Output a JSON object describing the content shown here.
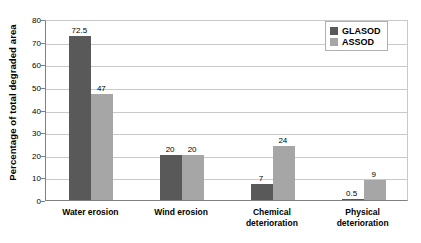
{
  "chart_data": {
    "type": "bar",
    "title": "",
    "xlabel": "",
    "ylabel": "Percentage of total degraded area",
    "ylim": [
      0,
      80
    ],
    "yticks": [
      0,
      10,
      20,
      30,
      40,
      50,
      60,
      70,
      80
    ],
    "grid": true,
    "legend_position": "top-right",
    "categories": [
      "Water erosion",
      "Wind erosion",
      "Chemical\ndeterioration",
      "Physical\ndeterioration"
    ],
    "series": [
      {
        "name": "GLASOD",
        "color": "#595959",
        "values": [
          72.5,
          20,
          7,
          0.5
        ],
        "labels": [
          "72.5",
          "20",
          "7",
          "0.5"
        ]
      },
      {
        "name": "ASSOD",
        "color": "#a6a6a6",
        "values": [
          47,
          20,
          24,
          9
        ],
        "labels": [
          "47",
          "20",
          "24",
          "9"
        ]
      }
    ]
  },
  "axis": {
    "y_title": "Percentage of total degraded area",
    "y_tick_labels": [
      "0",
      "10",
      "20",
      "30",
      "40",
      "50",
      "60",
      "70",
      "80"
    ]
  },
  "legend": {
    "items": [
      {
        "label": "GLASOD"
      },
      {
        "label": "ASSOD"
      }
    ]
  },
  "colors": {
    "glasod": "#595959",
    "assod": "#a6a6a6",
    "gridline": "#c9c9c9",
    "axis": "#808080",
    "background": "#ffffff"
  }
}
